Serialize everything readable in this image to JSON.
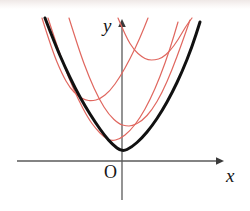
{
  "figure": {
    "background_color": "#ffffff",
    "width": 250,
    "height": 211
  },
  "labels": {
    "y_axis": "y",
    "x_axis": "x",
    "origin": "O"
  },
  "colors": {
    "axis": "#5a5a5a",
    "primary_curve": "#111111",
    "family_curve": "#e0675f"
  },
  "chart_data": {
    "type": "line",
    "xlabel": "x",
    "ylabel": "y",
    "grid": false,
    "legend": "none",
    "axes": {
      "origin_px": [
        122,
        161
      ],
      "x_axis_px": {
        "x1": 17,
        "x2": 223,
        "y": 161,
        "arrow": "right"
      },
      "y_axis_px": {
        "x": 122,
        "y1": 20,
        "y2": 200,
        "arrow": "up"
      },
      "xlim": [
        -2.8,
        1.5
      ],
      "ylim": [
        -0.55,
        2.1
      ]
    },
    "series": [
      {
        "name": "envelope-parabola",
        "color": "#111111",
        "width": 3.0,
        "vertex": [
          0,
          0
        ],
        "description": "thick black parabola, vertex at origin, opening upward",
        "points_px": [
          [
            45,
            18
          ],
          [
            55,
            44
          ],
          [
            65,
            67
          ],
          [
            75,
            88
          ],
          [
            85,
            106
          ],
          [
            95,
            122
          ],
          [
            105,
            136
          ],
          [
            112,
            144
          ],
          [
            122,
            152
          ],
          [
            132,
            147
          ],
          [
            142,
            138
          ],
          [
            152,
            126
          ],
          [
            162,
            111
          ],
          [
            172,
            93
          ],
          [
            182,
            72
          ],
          [
            192,
            47
          ],
          [
            200,
            22
          ]
        ]
      },
      {
        "name": "parabola-1",
        "color": "#e0675f",
        "width": 1.2,
        "vertex_px": [
          111,
          141
        ],
        "description": "red parabola, vertex just left of and above origin, lowest of the family",
        "points_px": [
          [
            48,
            18
          ],
          [
            58,
            49
          ],
          [
            68,
            76
          ],
          [
            78,
            99
          ],
          [
            88,
            118
          ],
          [
            96,
            129
          ],
          [
            104,
            137
          ],
          [
            111,
            141
          ],
          [
            120,
            139
          ],
          [
            130,
            131
          ],
          [
            140,
            118
          ],
          [
            150,
            100
          ],
          [
            160,
            77
          ],
          [
            170,
            49
          ],
          [
            178,
            22
          ]
        ]
      },
      {
        "name": "parabola-2",
        "color": "#e0675f",
        "width": 1.2,
        "vertex_px": [
          132,
          126
        ],
        "description": "red parabola, vertex right of y-axis, second lowest",
        "points_px": [
          [
            69,
            18
          ],
          [
            79,
            50
          ],
          [
            89,
            77
          ],
          [
            99,
            99
          ],
          [
            109,
            115
          ],
          [
            119,
            124
          ],
          [
            126,
            126
          ],
          [
            132,
            126
          ],
          [
            142,
            121
          ],
          [
            152,
            110
          ],
          [
            162,
            93
          ],
          [
            172,
            70
          ],
          [
            182,
            43
          ],
          [
            190,
            20
          ]
        ]
      },
      {
        "name": "parabola-3",
        "color": "#e0675f",
        "width": 1.2,
        "vertex_px": [
          92,
          101
        ],
        "description": "red parabola, vertex left of y-axis, mid height",
        "points_px": [
          [
            42,
            18
          ],
          [
            52,
            50
          ],
          [
            62,
            74
          ],
          [
            70,
            88
          ],
          [
            78,
            96
          ],
          [
            85,
            100
          ],
          [
            92,
            101
          ],
          [
            100,
            99
          ],
          [
            110,
            91
          ],
          [
            120,
            77
          ],
          [
            130,
            59
          ],
          [
            140,
            38
          ],
          [
            148,
            18
          ]
        ]
      },
      {
        "name": "parabola-4",
        "color": "#e0675f",
        "width": 1.2,
        "vertex_px": [
          155,
          60
        ],
        "description": "red parabola, vertex upper right, highest of the family",
        "points_px": [
          [
            118,
            18
          ],
          [
            126,
            37
          ],
          [
            134,
            50
          ],
          [
            142,
            57
          ],
          [
            148,
            60
          ],
          [
            155,
            60
          ],
          [
            162,
            58
          ],
          [
            170,
            51
          ],
          [
            178,
            40
          ],
          [
            186,
            26
          ],
          [
            192,
            18
          ]
        ]
      }
    ],
    "annotations": [
      {
        "text": "y",
        "position_px": [
          108,
          24
        ],
        "style": "italic"
      },
      {
        "text": "x",
        "position_px": [
          230,
          175
        ],
        "style": "italic"
      },
      {
        "text": "O",
        "position_px": [
          110,
          172
        ],
        "style": "roman"
      }
    ]
  }
}
